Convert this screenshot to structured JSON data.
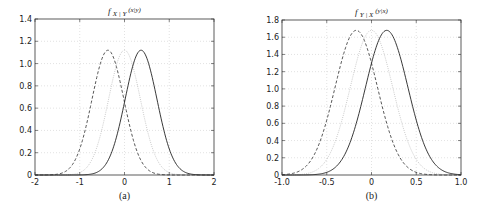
{
  "chart_data": [
    {
      "type": "line",
      "caption": "(a)",
      "title": "f X|Y (x|y)",
      "title_main": "f",
      "title_sub": "X | Y",
      "title_arg": "(x|y)",
      "xlabel": "",
      "ylabel": "",
      "xlim": [
        -2,
        2
      ],
      "ylim": [
        0,
        1.4
      ],
      "xticks": [
        -2,
        -1,
        0,
        1,
        2
      ],
      "xtick_labels": [
        "-2",
        "-1",
        "0",
        "1",
        "2"
      ],
      "yticks": [
        0,
        0.2,
        0.4,
        0.6,
        0.8,
        1.0,
        1.2,
        1.4
      ],
      "ytick_labels": [
        "0",
        "0.2",
        "0.4",
        "0.6",
        "0.8",
        "1.0",
        "1.2",
        "1.4"
      ],
      "grid": true,
      "series": [
        {
          "name": "dashed",
          "style": "dashed",
          "color": "#444444",
          "mean": -0.37,
          "sigma": 0.356,
          "peak": 1.12
        },
        {
          "name": "dotted",
          "style": "dotted",
          "color": "#bbbbbb",
          "mean": 0.0,
          "sigma": 0.356,
          "peak": 1.12
        },
        {
          "name": "solid",
          "style": "solid",
          "color": "#222222",
          "mean": 0.37,
          "sigma": 0.356,
          "peak": 1.12
        }
      ]
    },
    {
      "type": "line",
      "caption": "(b)",
      "title": "f Y|X (y|x)",
      "title_main": "f",
      "title_sub": "Y | X",
      "title_arg": "(y|x)",
      "xlabel": "",
      "ylabel": "",
      "xlim": [
        -1.0,
        1.0
      ],
      "ylim": [
        0,
        1.8
      ],
      "xticks": [
        -1.0,
        -0.5,
        0,
        0.5,
        1.0
      ],
      "xtick_labels": [
        "-1.0",
        "-0.5",
        "0",
        "0.5",
        "1.0"
      ],
      "yticks": [
        0,
        0.2,
        0.4,
        0.6,
        0.8,
        1.0,
        1.2,
        1.4,
        1.6,
        1.8
      ],
      "ytick_labels": [
        "0",
        "0.2",
        "0.4",
        "0.6",
        "0.8",
        "1.0",
        "1.2",
        "1.4",
        "1.6",
        "1.8"
      ],
      "grid": true,
      "series": [
        {
          "name": "dashed",
          "style": "dashed",
          "color": "#444444",
          "mean": -0.17,
          "sigma": 0.237,
          "peak": 1.68
        },
        {
          "name": "dotted",
          "style": "dotted",
          "color": "#bbbbbb",
          "mean": 0.0,
          "sigma": 0.237,
          "peak": 1.68
        },
        {
          "name": "solid",
          "style": "solid",
          "color": "#222222",
          "mean": 0.17,
          "sigma": 0.237,
          "peak": 1.68
        }
      ]
    }
  ]
}
